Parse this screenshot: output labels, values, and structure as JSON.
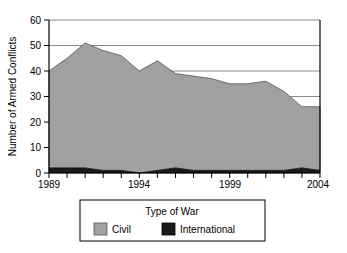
{
  "chart_data": {
    "type": "area",
    "stacked": true,
    "title": "",
    "xlabel": "",
    "ylabel": "Number of Armed Conflicts",
    "x": [
      1989,
      1990,
      1991,
      1992,
      1993,
      1994,
      1995,
      1996,
      1997,
      1998,
      1999,
      2000,
      2001,
      2002,
      2003,
      2004
    ],
    "xlim": [
      1989,
      2004
    ],
    "ylim": [
      0,
      60
    ],
    "xticks": [
      1989,
      1990,
      1991,
      1992,
      1993,
      1994,
      1995,
      1996,
      1997,
      1998,
      1999,
      2000,
      2001,
      2002,
      2003,
      2004
    ],
    "xtick_labels": [
      "1989",
      "",
      "",
      "",
      "",
      "1994",
      "",
      "",
      "",
      "",
      "1999",
      "",
      "",
      "",
      "",
      "2004"
    ],
    "yticks": [
      0,
      10,
      20,
      30,
      40,
      50,
      60
    ],
    "ytick_labels": [
      "0",
      "10",
      "20",
      "30",
      "40",
      "50",
      "60"
    ],
    "grid": "horizontal",
    "legend_position": "below",
    "series": [
      {
        "name": "International",
        "color": "#1a1a1a",
        "values": [
          2,
          2,
          2,
          1,
          1,
          0,
          1,
          2,
          1,
          1,
          1,
          1,
          1,
          1,
          2,
          1
        ]
      },
      {
        "name": "Civil",
        "color": "#a0a0a0",
        "values": [
          38,
          43,
          49,
          47,
          45,
          40,
          43,
          37,
          37,
          36,
          34,
          34,
          35,
          31,
          24,
          25
        ]
      }
    ],
    "totals": [
      40,
      45,
      51,
      48,
      46,
      40,
      44,
      39,
      38,
      37,
      35,
      35,
      36,
      32,
      26,
      26
    ]
  },
  "axes": {
    "y_axis_title": "Number of Armed Conflicts",
    "y_tick_60": "60",
    "y_tick_50": "50",
    "y_tick_40": "40",
    "y_tick_30": "30",
    "y_tick_20": "20",
    "y_tick_10": "10",
    "y_tick_0": "0",
    "x_tick_1989": "1989",
    "x_tick_1994": "1994",
    "x_tick_1999": "1999",
    "x_tick_2004": "2004"
  },
  "legend": {
    "title": "Type of War",
    "entries": [
      {
        "label": "Civil",
        "color": "#a0a0a0"
      },
      {
        "label": "International",
        "color": "#1a1a1a"
      }
    ]
  },
  "colors": {
    "civil": "#a0a0a0",
    "international": "#1a1a1a",
    "axis": "#000000",
    "grid": "#999999",
    "background": "#ffffff"
  }
}
